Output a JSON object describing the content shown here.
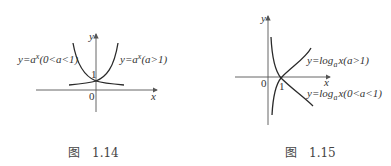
{
  "figures": [
    {
      "caption": "图　1.14",
      "axes": {
        "x_label": "x",
        "y_label": "y",
        "origin_label": "0",
        "intercept_label": "1"
      },
      "curves": [
        {
          "name": "exp-decay",
          "label": "y=aˣ(0<a<1)",
          "label_parts": {
            "lhs": "y=a",
            "sup": "x",
            "cond": "(0<a<1)"
          }
        },
        {
          "name": "exp-growth",
          "label": "y=aˣ(a>1)",
          "label_parts": {
            "lhs": "y=a",
            "sup": "x",
            "cond": "(a>1)"
          }
        }
      ]
    },
    {
      "caption": "图　1.15",
      "axes": {
        "x_label": "x",
        "y_label": "y",
        "origin_label": "0",
        "intercept_label": "1"
      },
      "curves": [
        {
          "name": "log-increasing",
          "label": "y=logₐx(a>1)",
          "label_parts": {
            "lhs": "y=log",
            "sub": "a",
            "arg": "x",
            "cond": "(a>1)"
          }
        },
        {
          "name": "log-decreasing",
          "label": "y=logₐx(0<a<1)",
          "label_parts": {
            "lhs": "y=log",
            "sub": "a",
            "arg": "x",
            "cond": "(0<a<1)"
          }
        }
      ]
    }
  ],
  "colors": {
    "stroke": "#2a2a2a",
    "axis": "#555555",
    "text": "#333333"
  }
}
